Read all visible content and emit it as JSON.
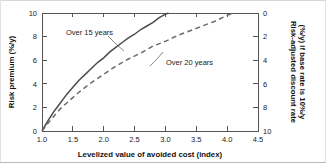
{
  "chart_data": {
    "type": "line",
    "title": "",
    "xlabel": "Levelized value of avoided cost (index)",
    "ylabel": "Risk premium (%/y)",
    "y2label_line1": "Risk-adjusted discount rate",
    "y2label_line2": "(%/y) if base rate is 10%/y",
    "xlim": [
      1.0,
      4.5
    ],
    "ylim": [
      0,
      10
    ],
    "y2lim": [
      10,
      0
    ],
    "grid": false,
    "legend": "inline-annotations",
    "xticks": [
      "1.0",
      "1.5",
      "2.0",
      "2.5",
      "3.0",
      "3.5",
      "4.0",
      "4.5"
    ],
    "xtick_values": [
      1.0,
      1.5,
      2.0,
      2.5,
      3.0,
      3.5,
      4.0,
      4.5
    ],
    "yticks": [
      "0",
      "2",
      "4",
      "6",
      "8",
      "10"
    ],
    "ytick_values": [
      0,
      2,
      4,
      6,
      8,
      10
    ],
    "y2ticks": [
      "0",
      "2",
      "4",
      "6",
      "8",
      "10"
    ],
    "y2tick_values": [
      0,
      2,
      4,
      6,
      8,
      10
    ],
    "series": [
      {
        "name": "Over 15 years",
        "style": "solid",
        "color": "#4c4c4c",
        "x": [
          1.0,
          1.1,
          1.2,
          1.3,
          1.4,
          1.5,
          1.6,
          1.7,
          1.8,
          1.9,
          2.0,
          2.1,
          2.2,
          2.3,
          2.4,
          2.5,
          2.6,
          2.7,
          2.8,
          2.9,
          3.0,
          3.05
        ],
        "values": [
          0.0,
          0.9,
          1.7,
          2.4,
          3.1,
          3.7,
          4.3,
          4.8,
          5.3,
          5.8,
          6.2,
          6.7,
          7.1,
          7.5,
          7.9,
          8.2,
          8.6,
          8.9,
          9.2,
          9.6,
          9.9,
          10.0
        ]
      },
      {
        "name": "Over 20 years",
        "style": "dashed",
        "color": "#6a6a6a",
        "x": [
          1.0,
          1.15,
          1.3,
          1.45,
          1.6,
          1.8,
          2.0,
          2.2,
          2.4,
          2.6,
          2.8,
          3.0,
          3.2,
          3.4,
          3.6,
          3.8,
          4.0,
          4.1
        ],
        "values": [
          0.0,
          1.0,
          1.9,
          2.6,
          3.3,
          4.1,
          4.8,
          5.5,
          6.1,
          6.6,
          7.2,
          7.6,
          8.1,
          8.5,
          8.9,
          9.3,
          9.8,
          10.0
        ]
      }
    ],
    "annotations": [
      {
        "text": "Over 15 years",
        "target_series": "Over 15 years"
      },
      {
        "text": "Over 20 years",
        "target_series": "Over 20 years"
      }
    ]
  }
}
